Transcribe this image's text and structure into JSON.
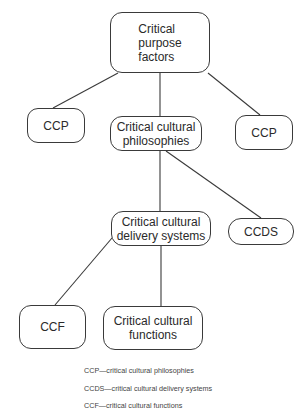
{
  "diagram": {
    "nodes": {
      "root": "Critical\npurpose\nfactors",
      "ccp_left": "CCP",
      "philosophies": "Critical cultural\nphilosophies",
      "ccp_right": "CCP",
      "delivery": "Critical cultural\ndelivery  systems",
      "ccds": "CCDS",
      "ccf": "CCF",
      "functions": "Critical cultural\nfunctions"
    },
    "edges": [
      [
        "root",
        "ccp_left"
      ],
      [
        "root",
        "philosophies"
      ],
      [
        "root",
        "ccp_right"
      ],
      [
        "philosophies",
        "delivery"
      ],
      [
        "philosophies",
        "ccds"
      ],
      [
        "delivery",
        "ccf"
      ],
      [
        "delivery",
        "functions"
      ]
    ],
    "legend": [
      "CCP—critical cultural philosophies",
      "CCDS—critical cultural delivery systems",
      "CCF—critical cultural functions"
    ]
  }
}
